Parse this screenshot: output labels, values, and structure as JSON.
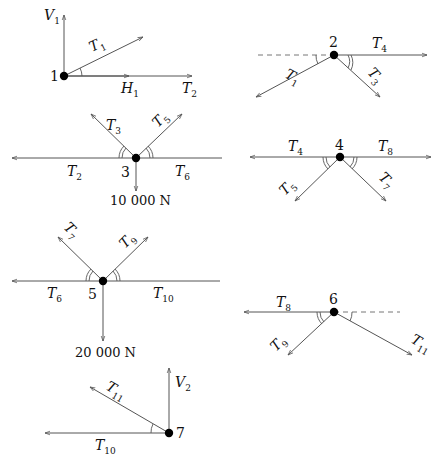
{
  "colors": {
    "line": "#555555",
    "node": "#000000",
    "text": "#111111"
  },
  "joints": [
    {
      "id": "1",
      "label": "1",
      "forces": [
        "V_1",
        "T_1",
        "H_1",
        "T_2"
      ],
      "labels": {
        "v": "V",
        "v_sub": "1",
        "t1": "T",
        "t1_sub": "1",
        "h": "H",
        "h_sub": "1",
        "t2": "T",
        "t2_sub": "2"
      }
    },
    {
      "id": "2",
      "label": "2",
      "forces": [
        "T_1",
        "T_3",
        "T_4"
      ],
      "labels": {
        "t4": "T",
        "t4_sub": "4",
        "t1": "T",
        "t1_sub": "1",
        "t3": "T",
        "t3_sub": "3"
      }
    },
    {
      "id": "3",
      "label": "3",
      "load": "10 000 N",
      "forces": [
        "T_2",
        "T_3",
        "T_5",
        "T_6"
      ],
      "labels": {
        "t3": "T",
        "t3_sub": "3",
        "t5": "T",
        "t5_sub": "5",
        "t2": "T",
        "t2_sub": "2",
        "t6": "T",
        "t6_sub": "6"
      }
    },
    {
      "id": "4",
      "label": "4",
      "forces": [
        "T_4",
        "T_5",
        "T_7",
        "T_8"
      ],
      "labels": {
        "t4": "T",
        "t4_sub": "4",
        "t8": "T",
        "t8_sub": "8",
        "t5": "T",
        "t5_sub": "5",
        "t7": "T",
        "t7_sub": "7"
      }
    },
    {
      "id": "5",
      "label": "5",
      "load": "20 000 N",
      "forces": [
        "T_6",
        "T_7",
        "T_9",
        "T_10"
      ],
      "labels": {
        "t7": "T",
        "t7_sub": "7",
        "t9": "T",
        "t9_sub": "9",
        "t6": "T",
        "t6_sub": "6",
        "t10": "T",
        "t10_sub": "10"
      }
    },
    {
      "id": "6",
      "label": "6",
      "forces": [
        "T_8",
        "T_9",
        "T_11"
      ],
      "labels": {
        "t8": "T",
        "t8_sub": "8",
        "t9": "T",
        "t9_sub": "9",
        "t11": "T",
        "t11_sub": "11"
      }
    },
    {
      "id": "7",
      "label": "7",
      "forces": [
        "T_10",
        "T_11",
        "V_2"
      ],
      "labels": {
        "t11": "T",
        "t11_sub": "11",
        "v": "V",
        "v_sub": "2",
        "t10": "T",
        "t10_sub": "10"
      }
    }
  ]
}
